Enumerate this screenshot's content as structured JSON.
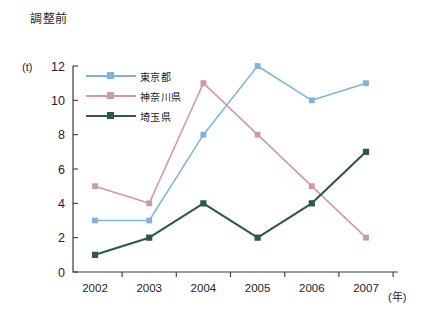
{
  "chart_data": {
    "type": "line",
    "title": "調整前",
    "xlabel": "(年)",
    "ylabel": "(t)",
    "ylim": [
      0,
      12
    ],
    "yticks": [
      0,
      2,
      4,
      6,
      8,
      10,
      12
    ],
    "categories": [
      "2002",
      "2003",
      "2004",
      "2005",
      "2006",
      "2007"
    ],
    "grid": false,
    "legend_position": "top-left-inside",
    "series": [
      {
        "name": "東京都",
        "color": "#7fb3dd",
        "marker": "square",
        "values": [
          3,
          3,
          8,
          12,
          10,
          11
        ]
      },
      {
        "name": "神奈川県",
        "color": "#d196a8",
        "marker": "square",
        "values": [
          5,
          4,
          11,
          8,
          5,
          2
        ]
      },
      {
        "name": "埼玉県",
        "color": "#2b5b40",
        "marker": "square",
        "values": [
          1,
          2,
          4,
          2,
          4,
          7
        ]
      }
    ]
  },
  "axis": {
    "y_unit_label": "(t)",
    "x_unit_label": "(年)"
  }
}
